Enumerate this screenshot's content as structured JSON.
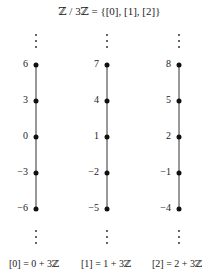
{
  "title": "ℤ / 3ℤ = {[0], [1], [2]}",
  "colors": {
    "line": "#333333",
    "point": "#111111",
    "text": "#222222"
  },
  "columns": [
    {
      "class_label": "[0] = 0 + 3ℤ",
      "values": [
        "6",
        "3",
        "0",
        "−3",
        "−6"
      ]
    },
    {
      "class_label": "[1] = 1 + 3ℤ",
      "values": [
        "7",
        "4",
        "1",
        "−2",
        "−5"
      ]
    },
    {
      "class_label": "[2] = 2 + 3ℤ",
      "values": [
        "8",
        "5",
        "2",
        "−1",
        "−4"
      ]
    }
  ],
  "continuation_symbol": "vertical-ellipsis"
}
